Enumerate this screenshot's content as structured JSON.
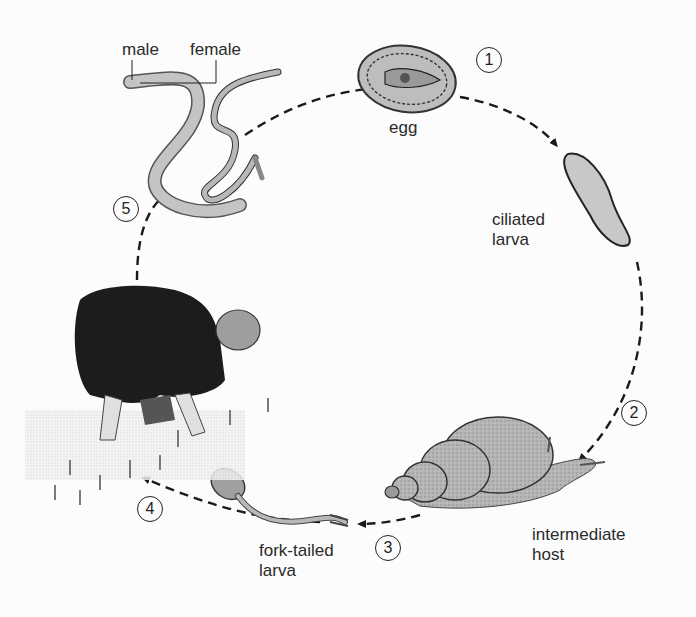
{
  "diagram": {
    "type": "life-cycle",
    "stages": [
      {
        "step": "1",
        "label": "egg"
      },
      {
        "step": "2",
        "label": "ciliated larva"
      },
      {
        "step": "3",
        "label": "intermediate host"
      },
      {
        "step": "4",
        "label": "fork-tailed larva"
      },
      {
        "step": "5",
        "label": "human host (rice field worker)"
      }
    ],
    "labels": {
      "male": "male",
      "female": "female",
      "egg": "egg",
      "ciliated": "ciliated",
      "ciliated_larva_line2": "larva",
      "intermediate": "intermediate",
      "host": "host",
      "fork_tailed": "fork-tailed",
      "fork_tailed_line2": "larva"
    },
    "step_numbers": [
      "1",
      "2",
      "3",
      "4",
      "5"
    ],
    "colors": {
      "background": "#fcfcfc",
      "ink": "#222222",
      "shading": "#a8a8a8",
      "dark_cloth": "#1c1c1c"
    }
  }
}
